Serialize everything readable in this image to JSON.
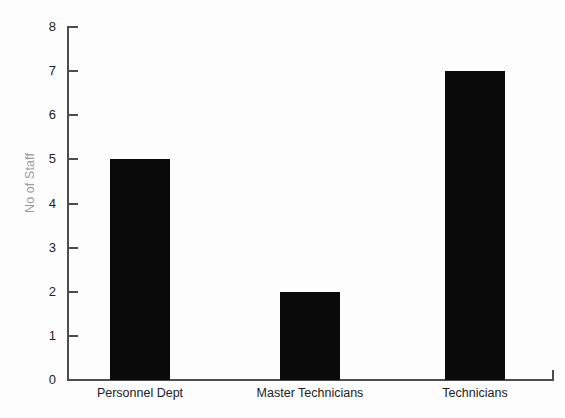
{
  "chart_data": {
    "type": "bar",
    "title": "",
    "xlabel": "",
    "ylabel": "No of Staff",
    "categories": [
      "Personnel Dept",
      "Master Technicians",
      "Technicians"
    ],
    "values": [
      5,
      2,
      7
    ],
    "ylim": [
      0,
      8
    ],
    "ytick_labels": [
      "0",
      "1",
      "2",
      "3",
      "4",
      "5",
      "6",
      "7",
      "8"
    ],
    "ytick_values": [
      0,
      1,
      2,
      3,
      4,
      5,
      6,
      7,
      8
    ],
    "grid": false,
    "legend": false,
    "legend_position": "none",
    "colors": {
      "bar": "#0a0a0a",
      "axis": "#4d4d4d",
      "ylabel_text": "#9d9d9d",
      "tick_text": "#1e1e1e",
      "category_text": "#212121",
      "background": "#fdfdfd"
    }
  }
}
